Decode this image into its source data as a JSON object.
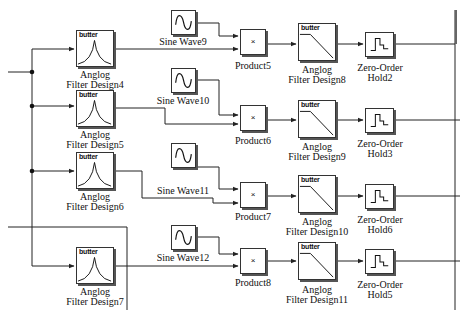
{
  "diagram": {
    "type": "simulink-block-diagram",
    "colors": {
      "line": "#222222",
      "block_border": "#333333",
      "shadow": "#555555",
      "background": "#ffffff"
    }
  },
  "bandpass_filters": [
    {
      "tag": "butter",
      "label_line1": "Anglog",
      "label_line2": "Filter Design4"
    },
    {
      "tag": "butter",
      "label_line1": "Anglog",
      "label_line2": "Filter Design5"
    },
    {
      "tag": "butter",
      "label_line1": "Anglog",
      "label_line2": "Filter Design6"
    },
    {
      "tag": "butter",
      "label_line1": "Anglog",
      "label_line2": "Filter Design7"
    }
  ],
  "sine_waves": [
    {
      "label": "Sine Wave9"
    },
    {
      "label": "Sine Wave10"
    },
    {
      "label": "Sine Wave11"
    },
    {
      "label": "Sine Wave12"
    }
  ],
  "products": [
    {
      "symbol": "×",
      "label": "Product5"
    },
    {
      "symbol": "×",
      "label": "Product6"
    },
    {
      "symbol": "×",
      "label": "Product7"
    },
    {
      "symbol": "×",
      "label": "Product8"
    }
  ],
  "lowpass_filters": [
    {
      "tag": "butter",
      "label_line1": "Anglog",
      "label_line2": "Filter Design8"
    },
    {
      "tag": "butter",
      "label_line1": "Anglog",
      "label_line2": "Filter Design9"
    },
    {
      "tag": "butter",
      "label_line1": "Anglog",
      "label_line2": "Filter Design10"
    },
    {
      "tag": "butter",
      "label_line1": "Anglog",
      "label_line2": "Filter Design11"
    }
  ],
  "zero_order_holds": [
    {
      "label_line1": "Zero-Order",
      "label_line2": "Hold2"
    },
    {
      "label_line1": "Zero-Order",
      "label_line2": "Hold3"
    },
    {
      "label_line1": "Zero-Order",
      "label_line2": "Hold6"
    },
    {
      "label_line1": "Zero-Order",
      "label_line2": "Hold5"
    }
  ]
}
